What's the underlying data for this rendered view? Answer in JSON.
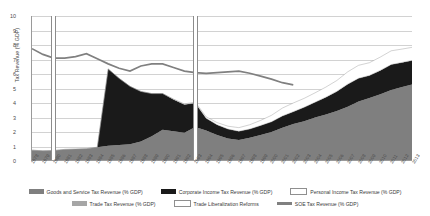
{
  "chart_data": {
    "type": "area",
    "title": "",
    "xlabel": "",
    "ylabel": "Tax Revenue (% GDP)",
    "ylim": [
      0,
      10
    ],
    "yticks": [
      0,
      1,
      2,
      3,
      4,
      5,
      6,
      7,
      8,
      9,
      10
    ],
    "grid": true,
    "legend_position": "bottom",
    "stacked": true,
    "categories": [
      "1978",
      "1979",
      "1980",
      "1981",
      "1982",
      "1983",
      "1984",
      "1985",
      "1986",
      "1987",
      "1988",
      "1989",
      "1990",
      "1991",
      "1992",
      "1993",
      "1994",
      "1995",
      "1996",
      "1997",
      "1998",
      "1999",
      "2000",
      "2001",
      "2002",
      "2003",
      "2004",
      "2005",
      "2006",
      "2007",
      "2008",
      "2009",
      "2010",
      "2011",
      "2012",
      "2013"
    ],
    "series": [
      {
        "name": "Goods and Service Tax Revenue (% GDP)",
        "color": "#7f7f7f",
        "values": [
          0.75,
          0.7,
          0.72,
          0.8,
          0.82,
          0.85,
          0.95,
          1.05,
          1.1,
          1.15,
          1.35,
          1.7,
          2.15,
          2.05,
          1.95,
          2.35,
          2.1,
          1.8,
          1.55,
          1.45,
          1.6,
          1.8,
          2.0,
          2.3,
          2.55,
          2.75,
          3.0,
          3.2,
          3.45,
          3.75,
          4.1,
          4.35,
          4.6,
          4.9,
          5.1,
          5.3
        ]
      },
      {
        "name": "Corporate Income Tax Revenue (% GDP)",
        "color": "#1a1a1a",
        "values": [
          0.0,
          0.0,
          0.0,
          0.0,
          0.0,
          0.0,
          0.0,
          5.3,
          4.6,
          4.0,
          3.45,
          2.95,
          2.5,
          2.2,
          1.95,
          1.65,
          0.85,
          0.7,
          0.65,
          0.6,
          0.6,
          0.65,
          0.7,
          0.8,
          0.85,
          0.95,
          1.05,
          1.2,
          1.35,
          1.55,
          1.6,
          1.55,
          1.65,
          1.75,
          1.7,
          1.65
        ]
      },
      {
        "name": "Personal Income Tax Revenue (% GDP)",
        "color": "#ffffff",
        "values": [
          0.0,
          0.0,
          0.0,
          0.0,
          0.0,
          0.0,
          0.0,
          0.0,
          0.0,
          0.0,
          0.0,
          0.0,
          0.0,
          0.02,
          0.04,
          0.06,
          0.1,
          0.15,
          0.2,
          0.25,
          0.3,
          0.35,
          0.45,
          0.55,
          0.6,
          0.62,
          0.65,
          0.7,
          0.75,
          0.85,
          0.9,
          0.88,
          0.92,
          0.95,
          0.92,
          0.9
        ]
      },
      {
        "name": "Trade Tax Revenue (% GDP)",
        "color": "#a6a6a6",
        "values": [
          0.0,
          0.0,
          0.0,
          0.0,
          0.0,
          0.0,
          0.0,
          0.0,
          0.0,
          0.0,
          0.0,
          0.0,
          0.0,
          0.0,
          0.0,
          0.0,
          0.0,
          0.0,
          0.0,
          0.0,
          0.0,
          0.0,
          0.0,
          0.0,
          0.0,
          0.0,
          0.0,
          0.0,
          0.0,
          0.0,
          0.0,
          0.0,
          0.0,
          0.0,
          0.0,
          0.0
        ]
      }
    ],
    "line_series": [
      {
        "name": "SOE Tax Revenue (% GDP)",
        "color": "#808080",
        "values": [
          7.75,
          7.35,
          7.1,
          7.1,
          7.2,
          7.4,
          7.05,
          6.7,
          6.4,
          6.2,
          6.55,
          6.7,
          6.7,
          6.45,
          6.2,
          6.1,
          6.05,
          6.1,
          6.15,
          6.2,
          6.05,
          5.85,
          5.65,
          5.4,
          5.25,
          null,
          null,
          null,
          null,
          null,
          null,
          null,
          null,
          null,
          null,
          null
        ]
      }
    ],
    "reform_markers": {
      "name": "Trade Liberalization Reforms",
      "color": "#ffffff",
      "years": [
        "1980",
        "1993"
      ]
    }
  },
  "legend": {
    "rows": [
      [
        {
          "label": "Goods and Service Tax Revenue (% GDP)",
          "swatch": "fill",
          "color": "#7f7f7f"
        },
        {
          "label": "Corporate Income Tax Revenue (% GDP)",
          "swatch": "fill",
          "color": "#1a1a1a"
        },
        {
          "label": "Personal Income Tax Revenue (% GDP)",
          "swatch": "outline",
          "color": "#ffffff"
        }
      ],
      [
        {
          "label": "Trade Tax Revenue (% GDP)",
          "swatch": "fill",
          "color": "#a6a6a6"
        },
        {
          "label": "Trade Liberalization Reforms",
          "swatch": "outline",
          "color": "#ffffff"
        },
        {
          "label": "SOE Tax Revenue (% GDP)",
          "swatch": "line",
          "color": "#808080"
        }
      ]
    ]
  }
}
